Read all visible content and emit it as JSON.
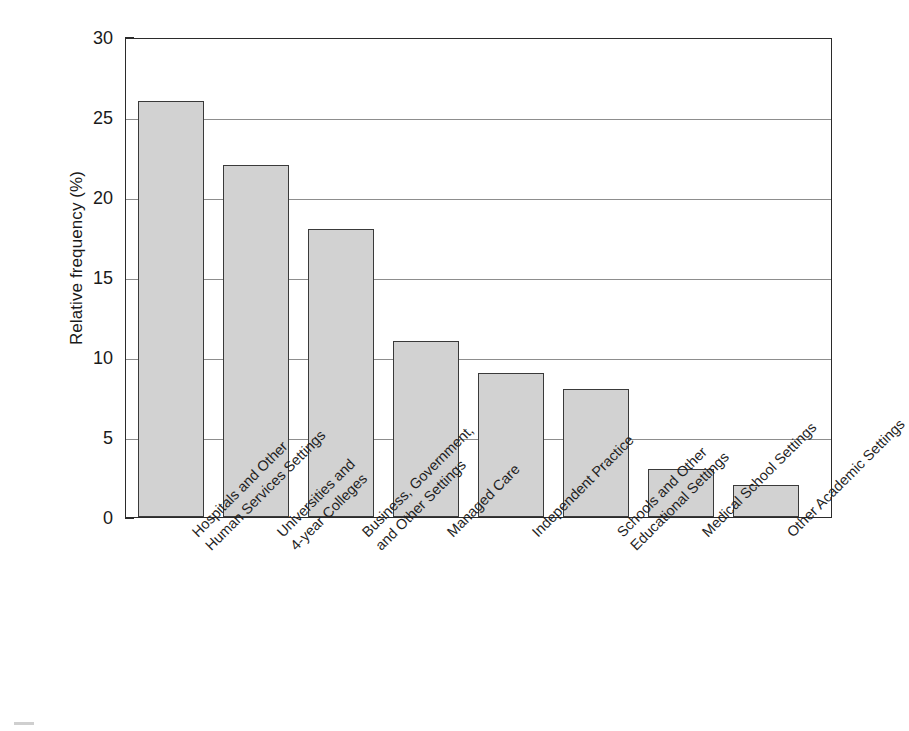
{
  "chart_data": {
    "type": "bar",
    "title": "",
    "subtitle": "",
    "xlabel": "",
    "ylabel": "Relative frequency (%)",
    "ylim": [
      0,
      30
    ],
    "ytick_labels": [
      "0",
      "5",
      "10",
      "15",
      "20",
      "25",
      "30"
    ],
    "ytick_values": [
      0,
      5,
      10,
      15,
      20,
      25,
      30
    ],
    "grid": "horizontal",
    "legend": "none",
    "bar_fill_color": "#d2d2d2",
    "bar_edge_color": "#3a3a3a",
    "axis_color": "#2b2b2b",
    "gridline_color": "#8d8d8d",
    "categories": [
      "Hospitals and Other Human Services Settings",
      "Universities and 4-year Colleges",
      "Business, Government, and Other Settings",
      "Managed Care",
      "Independent Practice",
      "Schools and Other Educational Settings",
      "Medical School Settings",
      "Other Academic Settings"
    ],
    "values": [
      26,
      22,
      18,
      11,
      9,
      8,
      3,
      2
    ],
    "bars": [
      {
        "line1": "Hospitals and Other",
        "line2": "Human Services Settings",
        "value": 26,
        "left": 12,
        "width": 66
      },
      {
        "line1": "Universities and",
        "line2": "4-year Colleges",
        "value": 22,
        "left": 97,
        "width": 66
      },
      {
        "line1": "Business, Government,",
        "line2": "and Other Settings",
        "value": 18,
        "left": 182,
        "width": 66
      },
      {
        "line1": "Managed Care",
        "line2": "",
        "value": 11,
        "left": 267,
        "width": 66
      },
      {
        "line1": "Independent Practice",
        "line2": "",
        "value": 9,
        "left": 352,
        "width": 66
      },
      {
        "line1": "Schools and Other",
        "line2": "Educational Settings",
        "value": 8,
        "left": 437,
        "width": 66
      },
      {
        "line1": "Medical School Settings",
        "line2": "",
        "value": 3,
        "left": 522,
        "width": 66
      },
      {
        "line1": "Other Academic Settings",
        "line2": "",
        "value": 2,
        "left": 607,
        "width": 66
      }
    ]
  }
}
